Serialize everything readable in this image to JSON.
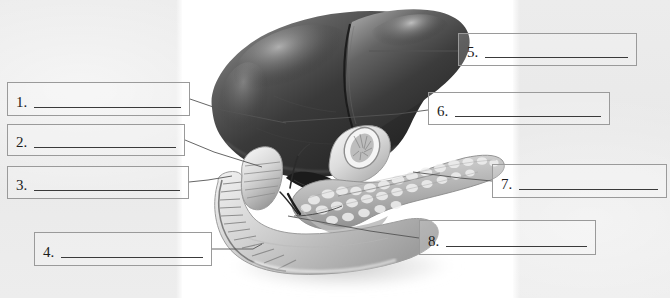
{
  "page": {
    "width": 670,
    "height": 298,
    "background_color": "#ebebeb",
    "panel_color": "#ffffff",
    "box_border_color": "#9a9a9a",
    "rule_color": "#3a3a3a",
    "leader_color": "#555555"
  },
  "worksheet": {
    "type": "anatomy-labeling-diagram",
    "illustration": {
      "name": "liver-pancreas-duodenum-illustration",
      "style": "grayscale-medical-illustration",
      "parts": [
        "liver-right-lobe",
        "liver-left-lobe",
        "gallbladder",
        "pancreas",
        "duodenum",
        "stomach-pylorus",
        "common-bile-duct"
      ]
    },
    "answer_boxes": [
      {
        "id": "box-1",
        "number": "1.",
        "answer": "",
        "x": 7,
        "y": 82,
        "w": 183,
        "h": 34,
        "rule_inset": 22
      },
      {
        "id": "box-2",
        "number": "2.",
        "answer": "",
        "x": 7,
        "y": 124,
        "w": 178,
        "h": 32,
        "rule_inset": 22
      },
      {
        "id": "box-3",
        "number": "3.",
        "answer": "",
        "x": 7,
        "y": 166,
        "w": 182,
        "h": 33,
        "rule_inset": 22
      },
      {
        "id": "box-4",
        "number": "4.",
        "answer": "",
        "x": 34,
        "y": 232,
        "w": 178,
        "h": 34,
        "rule_inset": 26
      },
      {
        "id": "box-5",
        "number": "5.",
        "answer": "",
        "x": 458,
        "y": 33,
        "w": 179,
        "h": 33,
        "rule_inset": 22
      },
      {
        "id": "box-6",
        "number": "6.",
        "answer": "",
        "x": 428,
        "y": 92,
        "w": 182,
        "h": 33,
        "rule_inset": 22
      },
      {
        "id": "box-7",
        "number": "7.",
        "answer": "",
        "x": 492,
        "y": 164,
        "w": 175,
        "h": 34,
        "rule_inset": 22
      },
      {
        "id": "box-8",
        "number": "8.",
        "answer": "",
        "x": 419,
        "y": 220,
        "w": 177,
        "h": 35,
        "rule_inset": 26
      }
    ],
    "leader_lines": [
      {
        "id": "leader-1",
        "from_box": "box-1",
        "points": "190,99 222,110 286,123"
      },
      {
        "id": "leader-2",
        "from_box": "box-2",
        "points": "185,140 214,152 262,167"
      },
      {
        "id": "leader-3",
        "from_box": "box-3",
        "points": "189,182 208,180 232,176"
      },
      {
        "id": "leader-4",
        "from_box": "box-4",
        "points": "212,249 253,249 262,244"
      },
      {
        "id": "leader-5",
        "from_box": "box-5",
        "points": "458,51 424,51 369,51"
      },
      {
        "id": "leader-6",
        "from_box": "box-6",
        "points": "428,110 398,114 283,122"
      },
      {
        "id": "leader-7",
        "from_box": "box-7",
        "points": "492,181 460,178 413,172"
      },
      {
        "id": "leader-8",
        "from_box": "box-8",
        "points": "419,238 370,231 288,216"
      }
    ]
  }
}
